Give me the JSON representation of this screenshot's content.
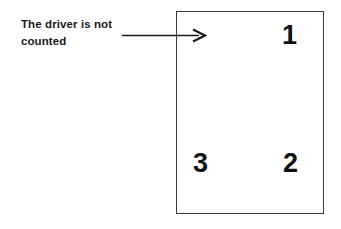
{
  "diagram": {
    "caption": {
      "text": "The driver is not\ncounted",
      "lines": [
        "The driver is not",
        "counted"
      ]
    },
    "annotation_arrow": {
      "icon": "arrow-right-icon",
      "points_to": "front-left-interior-of-vehicle",
      "color": "#1a1a1a"
    },
    "vehicle_outline": {
      "shape": "rectangle",
      "border_color": "#3a3a3a",
      "fill_color": "#ffffff"
    },
    "seat_positions": [
      {
        "label": "1",
        "location": "top-right"
      },
      {
        "label": "2",
        "location": "bottom-right"
      },
      {
        "label": "3",
        "location": "bottom-left"
      }
    ],
    "colors": {
      "background": "#ffffff",
      "ink": "#111111",
      "outline": "#3a3a3a"
    }
  }
}
